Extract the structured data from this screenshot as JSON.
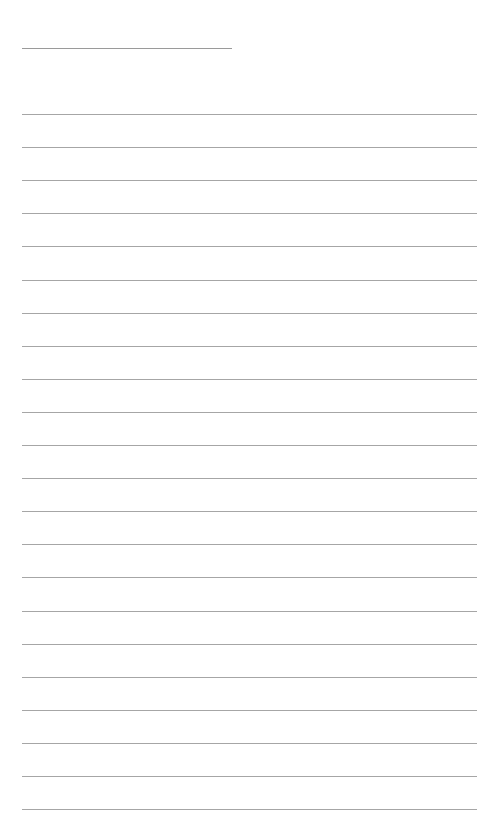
{
  "document": {
    "type": "lined-writing-page",
    "background_color": "#ffffff",
    "line_color": "#a6a6a6",
    "header_line": {
      "x_start": 22,
      "x_end": 232,
      "y": 48
    },
    "ruled_lines": {
      "count": 22,
      "x_start": 22,
      "x_end": 477,
      "first_y": 114,
      "spacing": 33.1
    }
  }
}
